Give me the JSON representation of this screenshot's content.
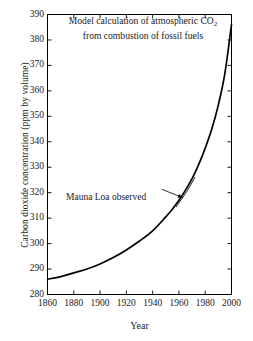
{
  "chart_data": {
    "type": "line",
    "title": "Model calculation of atmospheric CO2 from combustion of fossil fuels",
    "title_line1": "Model calculation of atmospheric CO",
    "title_line1_sub": "2",
    "title_line2": "from combustion of fossil fuels",
    "xlabel": "Year",
    "ylabel": "Carbon dioxide concentration (ppm by volume)",
    "xlim": [
      1860,
      2000
    ],
    "ylim": [
      280,
      390
    ],
    "xticks": [
      1860,
      1880,
      1900,
      1920,
      1940,
      1960,
      1980,
      2000
    ],
    "yticks": [
      280,
      290,
      300,
      310,
      320,
      330,
      340,
      350,
      360,
      370,
      380,
      390
    ],
    "grid": false,
    "legend": "none",
    "annotations": [
      {
        "text": "Mauna Loa observed",
        "x": 1905,
        "y": 320,
        "arrow_to_x": 1963,
        "arrow_to_y": 318
      }
    ],
    "series": [
      {
        "name": "Model calculation of atmospheric CO2 from combustion of fossil fuels",
        "color": "#000000",
        "x": [
          1860,
          1870,
          1880,
          1890,
          1900,
          1910,
          1920,
          1930,
          1940,
          1950,
          1955,
          1960,
          1965,
          1970,
          1975,
          1980,
          1985,
          1990,
          1995,
          2000
        ],
        "values": [
          286,
          287,
          288.5,
          290,
          292,
          294.5,
          297.5,
          301,
          305,
          310.5,
          313.5,
          317,
          321,
          325.5,
          331,
          337.5,
          345,
          354.5,
          367,
          386
        ]
      },
      {
        "name": "Mauna Loa observed",
        "color": "#000000",
        "x": [
          1958,
          1962,
          1966,
          1970,
          1972
        ],
        "values": [
          314.5,
          317.5,
          320.5,
          324,
          326
        ]
      }
    ]
  }
}
